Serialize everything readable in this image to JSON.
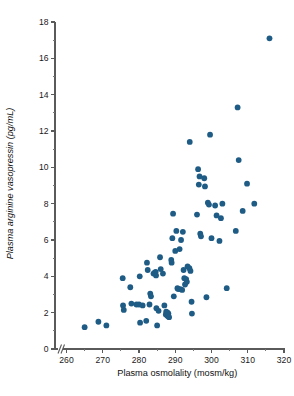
{
  "chart_data": {
    "type": "scatter",
    "title": "",
    "xlabel": "Plasma osmolality (mosm/kg)",
    "ylabel": "Plasma arginine vasopressin (pg/mL)",
    "xlim": [
      260,
      320
    ],
    "ylim": [
      0,
      18
    ],
    "x_ticks": [
      260,
      270,
      280,
      290,
      300,
      310,
      320
    ],
    "x_tick_labels": [
      "260",
      "270",
      "280",
      "290",
      "300",
      "310",
      "320"
    ],
    "x_minor_ticks": [
      265,
      275,
      285,
      295,
      305,
      315
    ],
    "y_ticks": [
      0,
      2,
      4,
      6,
      8,
      10,
      12,
      14,
      16,
      18
    ],
    "y_tick_labels": [
      "0",
      "2",
      "4",
      "6",
      "8",
      "10",
      "12",
      "14",
      "16",
      "18"
    ],
    "y_minor_ticks": [
      1,
      3,
      5,
      7,
      9,
      11,
      13,
      15,
      17
    ],
    "grid": false,
    "legend": null,
    "axis_break": {
      "axis": "x",
      "symbol": "//",
      "note": "broken x-axis between origin and 260"
    },
    "marker": {
      "shape": "circle",
      "color": "#1f5c85",
      "size_px": 3.0
    },
    "series": [
      {
        "name": "Subjects",
        "color": "#1f5c85",
        "points": [
          [
            265.0,
            1.2
          ],
          [
            268.8,
            1.5
          ],
          [
            271.0,
            1.3
          ],
          [
            275.5,
            3.9
          ],
          [
            275.6,
            2.4
          ],
          [
            275.8,
            2.15
          ],
          [
            277.6,
            3.4
          ],
          [
            277.9,
            2.5
          ],
          [
            279.3,
            2.45
          ],
          [
            280.0,
            2.45
          ],
          [
            280.2,
            4.0
          ],
          [
            280.3,
            1.45
          ],
          [
            281.0,
            2.4
          ],
          [
            282.0,
            1.55
          ],
          [
            282.2,
            4.75
          ],
          [
            282.4,
            4.35
          ],
          [
            282.9,
            2.45
          ],
          [
            283.1,
            3.05
          ],
          [
            283.3,
            2.9
          ],
          [
            284.0,
            4.15
          ],
          [
            284.3,
            4.2
          ],
          [
            284.6,
            4.25
          ],
          [
            284.7,
            4.05
          ],
          [
            284.8,
            2.25
          ],
          [
            285.0,
            1.3
          ],
          [
            285.4,
            2.1
          ],
          [
            285.8,
            5.05
          ],
          [
            286.0,
            4.4
          ],
          [
            286.6,
            4.15
          ],
          [
            287.0,
            2.4
          ],
          [
            287.4,
            1.9
          ],
          [
            287.5,
            2.05
          ],
          [
            287.8,
            1.85
          ],
          [
            287.9,
            2.0
          ],
          [
            288.0,
            1.8
          ],
          [
            288.1,
            1.95
          ],
          [
            288.3,
            1.75
          ],
          [
            288.9,
            4.9
          ],
          [
            289.0,
            4.75
          ],
          [
            289.2,
            6.1
          ],
          [
            289.4,
            7.45
          ],
          [
            289.6,
            2.9
          ],
          [
            290.0,
            5.4
          ],
          [
            290.3,
            6.5
          ],
          [
            290.6,
            3.35
          ],
          [
            290.8,
            3.3
          ],
          [
            291.2,
            5.5
          ],
          [
            291.4,
            3.3
          ],
          [
            291.6,
            6.0
          ],
          [
            291.9,
            3.25
          ],
          [
            292.1,
            6.45
          ],
          [
            292.3,
            4.35
          ],
          [
            292.5,
            3.9
          ],
          [
            292.7,
            3.55
          ],
          [
            293.0,
            3.85
          ],
          [
            293.2,
            3.7
          ],
          [
            293.4,
            4.55
          ],
          [
            293.9,
            4.45
          ],
          [
            294.0,
            11.4
          ],
          [
            294.2,
            4.3
          ],
          [
            294.5,
            2.6
          ],
          [
            294.6,
            1.95
          ],
          [
            296.0,
            7.4
          ],
          [
            296.3,
            9.9
          ],
          [
            296.5,
            9.05
          ],
          [
            296.7,
            9.5
          ],
          [
            296.9,
            6.35
          ],
          [
            297.1,
            6.2
          ],
          [
            298.0,
            9.4
          ],
          [
            298.2,
            8.95
          ],
          [
            298.6,
            2.85
          ],
          [
            299.0,
            8.05
          ],
          [
            299.3,
            7.95
          ],
          [
            299.6,
            11.8
          ],
          [
            300.0,
            6.1
          ],
          [
            301.0,
            7.9
          ],
          [
            301.4,
            7.35
          ],
          [
            302.2,
            5.95
          ],
          [
            302.6,
            7.2
          ],
          [
            303.0,
            8.0
          ],
          [
            304.2,
            3.35
          ],
          [
            306.7,
            6.5
          ],
          [
            307.2,
            13.3
          ],
          [
            307.5,
            10.4
          ],
          [
            308.6,
            7.6
          ],
          [
            309.8,
            9.1
          ],
          [
            311.8,
            8.0
          ],
          [
            316.0,
            17.1
          ]
        ]
      }
    ]
  }
}
